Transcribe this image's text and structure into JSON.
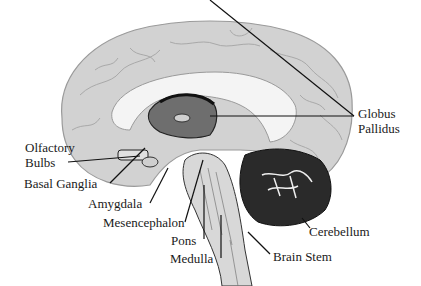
{
  "diagram": {
    "labels": {
      "globus_pallidus_1": "Globus",
      "globus_pallidus_2": "Pallidus",
      "olfactory_1": "Olfactory",
      "olfactory_2": "Bulbs",
      "basal_ganglia": "Basal Ganglia",
      "amygdala": "Amygdala",
      "mesencephalon": "Mesencephalon",
      "pons": "Pons",
      "medulla": "Medulla",
      "brain_stem": "Brain Stem",
      "cerebellum": "Cerebellum"
    },
    "colors": {
      "cortex": "#d4d4d4",
      "cortex_shadow": "#a8a8a8",
      "ink": "#1a1a1a",
      "cerebellum": "#2a2a2a",
      "background": "#ffffff"
    }
  }
}
